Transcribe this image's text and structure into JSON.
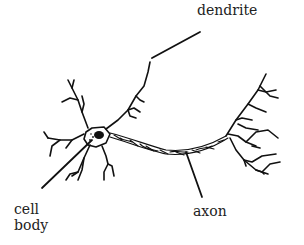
{
  "diagram": {
    "title": "",
    "labels": [
      {
        "id": "dendrite",
        "text": "dendrite",
        "x": 197,
        "y": 2
      },
      {
        "id": "cell-body",
        "text": "cell\nbody",
        "x": 14,
        "y": 201
      },
      {
        "id": "axon",
        "text": "axon",
        "x": 193,
        "y": 203
      }
    ],
    "leader_lines": [
      {
        "target": "dendrite",
        "from": [
          200,
          32
        ],
        "to": [
          152,
          58
        ]
      },
      {
        "target": "cell-body",
        "from": [
          42,
          188
        ],
        "to": [
          92,
          140
        ]
      },
      {
        "target": "axon",
        "from": [
          202,
          197
        ],
        "to": [
          186,
          152
        ]
      }
    ],
    "colors": {
      "ink": "#111111",
      "text": "#222222",
      "background": "#ffffff"
    }
  }
}
